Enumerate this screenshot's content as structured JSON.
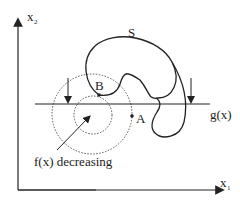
{
  "labels": {
    "y_axis": "x",
    "y_axis_sub": "2",
    "x_axis": "x",
    "x_axis_sub": "1",
    "set": "S",
    "constraint": "g(x)",
    "point_a": "A",
    "point_b": "B",
    "contour_note": "f(x) decreasing"
  },
  "colors": {
    "stroke": "#222222",
    "dotted": "#555555"
  }
}
